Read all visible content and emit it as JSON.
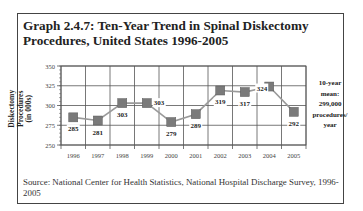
{
  "title": "Graph 2.4.7: Ten-Year Trend in Spinal Diskectomy Procedures, United States 1996-2005",
  "ylabel_line1": "Diskectomy Procedures",
  "ylabel_line2": "(in 000s)",
  "mean_note": {
    "lines": [
      "10-year",
      "mean:",
      "299,000",
      "procedures/",
      "year"
    ]
  },
  "source": "Source: National Center for Health Statistics, National Hospital Discharge Survey, 1996-2005",
  "colors": {
    "line": "#9a9a9a",
    "marker": "#7a7a7a",
    "grid": "#555555",
    "frame": "#444444"
  },
  "chart_data": {
    "type": "line",
    "title": "Graph 2.4.7: Ten-Year Trend in Spinal Diskectomy Procedures, United States 1996-2005",
    "xlabel": "",
    "ylabel": "Diskectomy Procedures (in 000s)",
    "categories": [
      "1996",
      "1997",
      "1998",
      "1999",
      "2000",
      "2001",
      "2002",
      "2003",
      "2004",
      "2005"
    ],
    "series": [
      {
        "name": "Spinal Diskectomy Procedures (000s)",
        "values": [
          285,
          281,
          303,
          303,
          279,
          289,
          319,
          317,
          324,
          292
        ]
      }
    ],
    "data_labels": [
      "285",
      "281",
      "303",
      "303",
      "279",
      "289",
      "319",
      "317",
      "324",
      "292"
    ],
    "yticks": [
      250,
      275,
      300,
      325,
      350
    ],
    "ylim": [
      250,
      350
    ],
    "grid": true,
    "legend": "none",
    "annotation": "10-year mean: 299,000 procedures/ year"
  }
}
